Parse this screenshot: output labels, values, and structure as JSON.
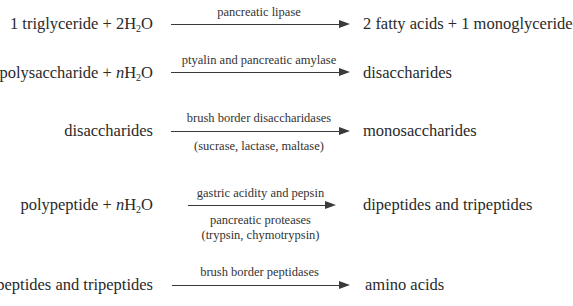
{
  "reactions": [
    {
      "reactant": "1 triglyceride + 2H",
      "reactant_sub": "2",
      "reactant_tail": "O",
      "enzyme_above": "pancreatic lipase",
      "product": "2 fatty acids + 1 monoglyceride"
    },
    {
      "reactant": "polysaccharide + ",
      "reactant_italic": "n",
      "reactant_mid": "H",
      "reactant_sub": "2",
      "reactant_tail": "O",
      "enzyme_above": "ptyalin and pancreatic amylase",
      "product": "disaccharides"
    },
    {
      "reactant": "disaccharides",
      "enzyme_above": "brush border disaccharidases",
      "enzyme_below": "(sucrase, lactase, maltase)",
      "product": "monosaccharides"
    },
    {
      "reactant": "polypeptide + ",
      "reactant_italic": "n",
      "reactant_mid": "H",
      "reactant_sub": "2",
      "reactant_tail": "O",
      "enzyme_above": "gastric acidity and pepsin",
      "enzyme_below_1": "pancreatic proteases",
      "enzyme_below_2": "(trypsin, chymotrypsin)",
      "product": "dipeptides and tripeptides"
    },
    {
      "reactant": "dipeptides and tripeptides",
      "enzyme_above": "brush border peptidases",
      "product": "amino acids"
    }
  ],
  "colors": {
    "text": "#2a2a2a",
    "arrow": "#3a3a3a",
    "background": "#ffffff"
  }
}
